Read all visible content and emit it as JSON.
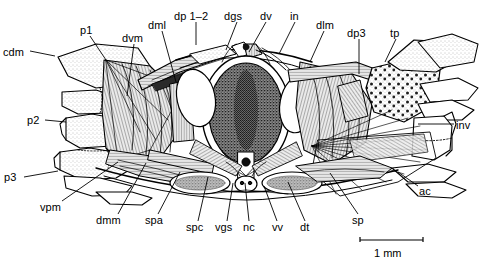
{
  "figure": {
    "kind": "anatomical-cross-section-illustration",
    "background_color": "#ffffff",
    "ink_color": "#000000",
    "width": 481,
    "height": 259
  },
  "scale_bar": {
    "label": "1 mm",
    "x1": 360,
    "x2": 423,
    "y": 240,
    "label_x": 374,
    "label_y": 247
  },
  "labels": [
    {
      "id": "cdm",
      "text": "cdm",
      "x": 3,
      "y": 47,
      "anchor": "start",
      "leader": [
        [
          30,
          51
        ],
        [
          55,
          56
        ]
      ]
    },
    {
      "id": "p1",
      "text": "p1",
      "x": 80,
      "y": 25,
      "anchor": "start",
      "leader": [
        [
          90,
          36
        ],
        [
          106,
          60
        ]
      ]
    },
    {
      "id": "dvm",
      "text": "dvm",
      "x": 122,
      "y": 33,
      "anchor": "start",
      "leader": [
        [
          134,
          44
        ],
        [
          127,
          96
        ]
      ]
    },
    {
      "id": "dml",
      "text": "dml",
      "x": 148,
      "y": 20,
      "anchor": "start",
      "leader": [
        [
          162,
          31
        ],
        [
          176,
          82
        ]
      ]
    },
    {
      "id": "dp1-2",
      "text": "dp 1–2",
      "x": 174,
      "y": 11,
      "anchor": "start",
      "leader": [
        [
          196,
          22
        ],
        [
          196,
          45
        ]
      ]
    },
    {
      "id": "dgs",
      "text": "dgs",
      "x": 224,
      "y": 11,
      "anchor": "start",
      "leader": [
        [
          237,
          22
        ],
        [
          226,
          50
        ]
      ]
    },
    {
      "id": "dv",
      "text": "dv",
      "x": 260,
      "y": 11,
      "anchor": "start",
      "leader": [
        [
          266,
          22
        ],
        [
          249,
          52
        ]
      ]
    },
    {
      "id": "in",
      "text": "in",
      "x": 290,
      "y": 11,
      "anchor": "start",
      "leader": [
        [
          295,
          22
        ],
        [
          279,
          54
        ]
      ]
    },
    {
      "id": "dlm",
      "text": "dlm",
      "x": 316,
      "y": 20,
      "anchor": "start",
      "leader": [
        [
          324,
          31
        ],
        [
          310,
          62
        ]
      ]
    },
    {
      "id": "dp3",
      "text": "dp3",
      "x": 347,
      "y": 28,
      "anchor": "start",
      "leader": [
        [
          359,
          39
        ],
        [
          359,
          74
        ]
      ]
    },
    {
      "id": "tp",
      "text": "tp",
      "x": 390,
      "y": 28,
      "anchor": "start",
      "leader": [
        [
          396,
          39
        ],
        [
          385,
          62
        ]
      ]
    },
    {
      "id": "inv",
      "text": "inv",
      "x": 456,
      "y": 120,
      "anchor": "start",
      "leader": [
        [
          454,
          124
        ],
        [
          418,
          124
        ]
      ]
    },
    {
      "id": "ac",
      "text": "ac",
      "x": 419,
      "y": 186,
      "anchor": "start",
      "leader": [
        [
          418,
          186
        ],
        [
          398,
          172
        ]
      ]
    },
    {
      "id": "p2",
      "text": "p2",
      "x": 27,
      "y": 115,
      "anchor": "start",
      "leader": [
        [
          45,
          120
        ],
        [
          66,
          122
        ]
      ]
    },
    {
      "id": "p3",
      "text": "p3",
      "x": 4,
      "y": 172,
      "anchor": "start",
      "leader": [
        [
          24,
          177
        ],
        [
          58,
          171
        ]
      ]
    },
    {
      "id": "vpm",
      "text": "vpm",
      "x": 40,
      "y": 202,
      "anchor": "start",
      "leader": [
        [
          62,
          201
        ],
        [
          118,
          162
        ]
      ]
    },
    {
      "id": "dmm",
      "text": "dmm",
      "x": 96,
      "y": 215,
      "anchor": "start",
      "leader": [
        [
          118,
          214
        ],
        [
          146,
          163
        ]
      ]
    },
    {
      "id": "spa",
      "text": "spa",
      "x": 145,
      "y": 215,
      "anchor": "start",
      "leader": [
        [
          158,
          214
        ],
        [
          180,
          172
        ]
      ]
    },
    {
      "id": "spc",
      "text": "spc",
      "x": 186,
      "y": 222,
      "anchor": "start",
      "leader": [
        [
          198,
          221
        ],
        [
          208,
          177
        ]
      ]
    },
    {
      "id": "vgs",
      "text": "vgs",
      "x": 215,
      "y": 222,
      "anchor": "start",
      "leader": [
        [
          227,
          221
        ],
        [
          233,
          183
        ]
      ]
    },
    {
      "id": "nc",
      "text": "nc",
      "x": 243,
      "y": 222,
      "anchor": "start",
      "leader": [
        [
          249,
          221
        ],
        [
          245,
          183
        ]
      ]
    },
    {
      "id": "vv",
      "text": "vv",
      "x": 272,
      "y": 222,
      "anchor": "start",
      "leader": [
        [
          277,
          221
        ],
        [
          264,
          186
        ]
      ]
    },
    {
      "id": "dt",
      "text": "dt",
      "x": 300,
      "y": 222,
      "anchor": "start",
      "leader": [
        [
          305,
          221
        ],
        [
          288,
          182
        ]
      ]
    },
    {
      "id": "sp",
      "text": "sp",
      "x": 352,
      "y": 215,
      "anchor": "start",
      "leader": [
        [
          358,
          214
        ],
        [
          330,
          173
        ]
      ]
    }
  ],
  "anatomy_notes": {
    "center_structure": "dark stippled oval (gut) inside white ring",
    "lateral_ovals": "two pale ovals flanking the central gut",
    "left_appendages": [
      "cdm plate",
      "p1",
      "p2",
      "p3"
    ],
    "right_appendages": [
      "tp",
      "inv",
      "ac"
    ]
  }
}
